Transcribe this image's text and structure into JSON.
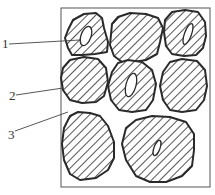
{
  "diagram": {
    "type": "microstructure-schematic",
    "frame": {
      "x": 61,
      "y": 8,
      "width": 149,
      "height": 179
    },
    "colors": {
      "stroke": "#2a2a2a",
      "hatch": "#2a2a2a",
      "background": "#ffffff",
      "label": "#333333"
    },
    "labels": [
      {
        "id": "1",
        "text": "1",
        "x": 2,
        "y": 47,
        "leader_to": [
          68,
          42
        ]
      },
      {
        "id": "2",
        "text": "2",
        "x": 10,
        "y": 98,
        "leader_to": [
          63,
          88
        ]
      },
      {
        "id": "3",
        "text": "3",
        "x": 9,
        "y": 137,
        "leader_to": [
          68,
          112
        ]
      }
    ],
    "grains": [
      {
        "id": "g1",
        "pos": "top-left",
        "has_void": true
      },
      {
        "id": "g2",
        "pos": "top-center",
        "has_void": false
      },
      {
        "id": "g3",
        "pos": "top-right",
        "has_void": true
      },
      {
        "id": "g4",
        "pos": "mid-left",
        "has_void": false
      },
      {
        "id": "g5",
        "pos": "mid-center",
        "has_void": true
      },
      {
        "id": "g6",
        "pos": "mid-right",
        "has_void": false
      },
      {
        "id": "g7",
        "pos": "bottom-left",
        "has_void": false
      },
      {
        "id": "g8",
        "pos": "bottom-right",
        "has_void": true
      }
    ]
  }
}
